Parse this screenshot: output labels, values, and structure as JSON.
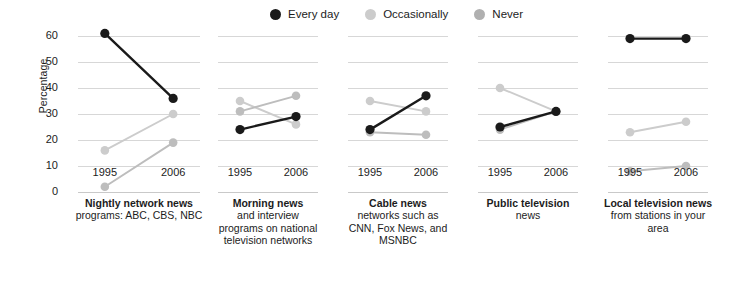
{
  "legend": {
    "position": "top-center",
    "items": [
      {
        "label": "Every day",
        "color": "#1a1a1a",
        "key": "every_day"
      },
      {
        "label": "Occasionally",
        "color": "#c9c9c9",
        "key": "occasionally"
      },
      {
        "label": "Never",
        "color": "#a8a8a8",
        "key": "never"
      }
    ]
  },
  "axes": {
    "ylabel": "Percentage",
    "yticks": [
      0,
      10,
      20,
      30,
      40,
      50,
      60
    ],
    "ylim": [
      0,
      63
    ],
    "xticks": [
      "1995",
      "2006"
    ],
    "grid": true
  },
  "chart_data": {
    "type": "line",
    "title": "",
    "subtitle": "",
    "xlabel": "",
    "ylabel": "Percentage",
    "x": [
      "1995",
      "2006"
    ],
    "ylim": [
      0,
      63
    ],
    "grid": true,
    "legend_position": "top-center",
    "panels": [
      {
        "title": "Nightly network news",
        "subtitle": "programs: ABC, CBS, NBC",
        "series": [
          {
            "name": "Every day",
            "color": "#1a1a1a",
            "values": [
              61,
              36
            ]
          },
          {
            "name": "Occasionally",
            "color": "#c9c9c9",
            "values": [
              16,
              30
            ]
          },
          {
            "name": "Never",
            "color": "#c9c9c9",
            "values": [
              2,
              19
            ]
          }
        ]
      },
      {
        "title": "Morning news",
        "subtitle": "and interview programs on national television networks",
        "series": [
          {
            "name": "Every day",
            "color": "#1a1a1a",
            "values": [
              24,
              29
            ]
          },
          {
            "name": "Occasionally",
            "color": "#c9c9c9",
            "values": [
              35,
              26
            ]
          },
          {
            "name": "Never",
            "color": "#c9c9c9",
            "values": [
              31,
              37
            ]
          }
        ]
      },
      {
        "title": "Cable news",
        "subtitle": "networks such as CNN, Fox News, and MSNBC",
        "series": [
          {
            "name": "Every day",
            "color": "#1a1a1a",
            "values": [
              24,
              37
            ]
          },
          {
            "name": "Occasionally",
            "color": "#c9c9c9",
            "values": [
              35,
              31
            ]
          },
          {
            "name": "Never",
            "color": "#c9c9c9",
            "values": [
              23,
              22
            ]
          }
        ]
      },
      {
        "title": "Public television",
        "subtitle": "news",
        "series": [
          {
            "name": "Every day",
            "color": "#1a1a1a",
            "values": [
              25,
              31
            ]
          },
          {
            "name": "Occasionally",
            "color": "#c9c9c9",
            "values": [
              40,
              31
            ]
          },
          {
            "name": "Never",
            "color": "#c9c9c9",
            "values": [
              24,
              31
            ]
          }
        ]
      },
      {
        "title": "Local television news",
        "subtitle": "from stations in your area",
        "series": [
          {
            "name": "Every day",
            "color": "#1a1a1a",
            "values": [
              59,
              59
            ]
          },
          {
            "name": "Occasionally",
            "color": "#c9c9c9",
            "values": [
              23,
              27
            ]
          },
          {
            "name": "Never",
            "color": "#c9c9c9",
            "values": [
              8,
              10
            ]
          }
        ]
      }
    ]
  },
  "panel_captions": [
    {
      "title": "Nightly network news",
      "lines": [
        "programs: ABC, CBS, NBC"
      ]
    },
    {
      "title": "Morning news",
      "lines": [
        "and interview",
        "programs on national",
        "television networks"
      ]
    },
    {
      "title": "Cable news",
      "lines": [
        "networks such as",
        "CNN, Fox News, and",
        "MSNBC"
      ]
    },
    {
      "title": "Public television",
      "lines": [
        "news"
      ]
    },
    {
      "title": "Local television news",
      "lines": [
        "from stations in your",
        "area"
      ]
    }
  ]
}
